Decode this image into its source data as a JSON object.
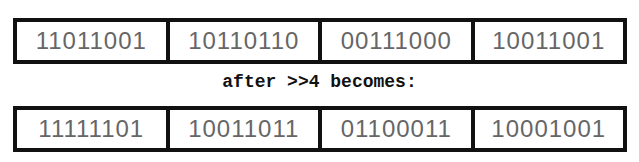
{
  "before": {
    "bytes": [
      "11011001",
      "10110110",
      "00111000",
      "10011001"
    ]
  },
  "caption": "after >>4 becomes:",
  "after": {
    "bytes": [
      "11111101",
      "10011011",
      "01100011",
      "10001001"
    ]
  }
}
